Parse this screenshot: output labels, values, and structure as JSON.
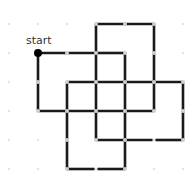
{
  "diagram": {
    "start_label": "start",
    "colors": {
      "path": "#1a1a1a",
      "grid_dot": "#d0d0d0",
      "start_dot": "#000000"
    },
    "grid": {
      "cols_x": [
        9,
        38,
        67,
        96,
        125,
        154,
        183
      ],
      "rows_y": [
        24,
        53,
        82,
        111,
        140,
        169
      ]
    },
    "start": [
      1,
      1
    ],
    "segments": [
      [
        [
          1,
          1
        ],
        [
          3,
          1
        ]
      ],
      [
        [
          1,
          1
        ],
        [
          1,
          3
        ]
      ],
      [
        [
          3,
          0
        ],
        [
          5,
          0
        ]
      ],
      [
        [
          3,
          0
        ],
        [
          3,
          4
        ]
      ],
      [
        [
          5,
          0
        ],
        [
          5,
          3
        ]
      ],
      [
        [
          3,
          1
        ],
        [
          4,
          1
        ]
      ],
      [
        [
          4,
          1
        ],
        [
          4,
          5
        ]
      ],
      [
        [
          2,
          2
        ],
        [
          6,
          2
        ]
      ],
      [
        [
          2,
          2
        ],
        [
          2,
          5
        ]
      ],
      [
        [
          6,
          2
        ],
        [
          6,
          4
        ]
      ],
      [
        [
          1,
          3
        ],
        [
          5,
          3
        ]
      ],
      [
        [
          3,
          4
        ],
        [
          4.95,
          4
        ]
      ],
      [
        [
          5.05,
          4
        ],
        [
          6,
          4
        ]
      ],
      [
        [
          2,
          5
        ],
        [
          2.95,
          5
        ]
      ],
      [
        [
          3.05,
          5
        ],
        [
          4,
          5
        ]
      ]
    ]
  }
}
